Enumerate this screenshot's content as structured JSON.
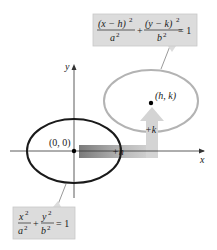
{
  "diagram": {
    "type": "ellipse-translation",
    "axes": {
      "x_label": "x",
      "y_label": "y"
    },
    "original_ellipse": {
      "center_label": "(0, 0)",
      "equation": {
        "term1_num": "x",
        "term1_den": "a",
        "term2_num": "y",
        "term2_den": "b",
        "exp": "2",
        "plus": "+",
        "equals": "= 1"
      },
      "stroke_color": "#1a1a1a"
    },
    "translated_ellipse": {
      "center_label": "(h, k)",
      "equation": {
        "term1_num": "(x − h)",
        "term1_den": "a",
        "term2_num": "(y − k)",
        "term2_den": "b",
        "exp": "2",
        "plus": "+",
        "equals": "= 1"
      },
      "stroke_color": "#b3b3b3"
    },
    "shift": {
      "horizontal_label": "+h",
      "vertical_label": "+k"
    },
    "colors": {
      "formula_box": "#dcdcdc",
      "formula_box_border": "#c8c8c8",
      "arrow_dark": "#7a7a7a",
      "arrow_light": "#d8d8d8"
    }
  }
}
